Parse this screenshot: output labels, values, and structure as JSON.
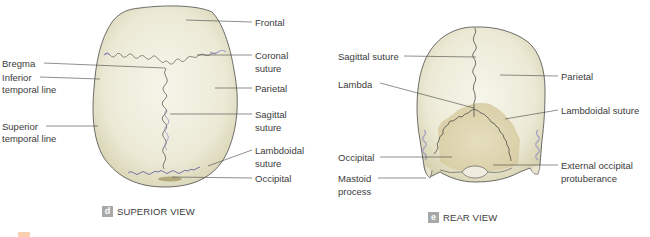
{
  "figure": {
    "panels": [
      {
        "id": "d",
        "badge": "d",
        "caption": "SUPERIOR VIEW",
        "labels_left": [
          {
            "text": "Bregma",
            "x": 2,
            "y": 58
          },
          {
            "text": "Inferior",
            "x": 2,
            "y": 72
          },
          {
            "text": "temporal line",
            "x": 2,
            "y": 84
          },
          {
            "text": "Superior",
            "x": 2,
            "y": 121
          },
          {
            "text": "temporal line",
            "x": 2,
            "y": 133
          }
        ],
        "labels_right": [
          {
            "text": "Frontal",
            "x": 255,
            "y": 17
          },
          {
            "text": "Coronal",
            "x": 255,
            "y": 50
          },
          {
            "text": "suture",
            "x": 255,
            "y": 63
          },
          {
            "text": "Parietal",
            "x": 255,
            "y": 83
          },
          {
            "text": "Sagittal",
            "x": 255,
            "y": 109
          },
          {
            "text": "suture",
            "x": 255,
            "y": 122
          },
          {
            "text": "Lambdoidal",
            "x": 255,
            "y": 145
          },
          {
            "text": "suture",
            "x": 255,
            "y": 158
          },
          {
            "text": "Occipital",
            "x": 255,
            "y": 173
          }
        ]
      },
      {
        "id": "e",
        "badge": "e",
        "caption": "REAR VIEW",
        "labels_left": [
          {
            "text": "Sagittal suture",
            "x": 338,
            "y": 51
          },
          {
            "text": "Lambda",
            "x": 338,
            "y": 79
          },
          {
            "text": "Occipital",
            "x": 338,
            "y": 152
          },
          {
            "text": "Mastoid",
            "x": 338,
            "y": 173
          },
          {
            "text": "process",
            "x": 338,
            "y": 186
          }
        ],
        "labels_right": [
          {
            "text": "Parietal",
            "x": 561,
            "y": 72
          },
          {
            "text": "Lambdoidal suture",
            "x": 561,
            "y": 106
          },
          {
            "text": "External occipital",
            "x": 561,
            "y": 160
          },
          {
            "text": "protuberance",
            "x": 561,
            "y": 173
          }
        ]
      }
    ],
    "colors": {
      "bone": "#efeedd",
      "bone_shade": "#ddd8b8",
      "occipital_tint": "#d9cfa6",
      "outline": "#4a4a4a",
      "suture_blue": "#8c88c0",
      "leader": "#444444",
      "badge_bg": "#a8a8a8"
    }
  }
}
